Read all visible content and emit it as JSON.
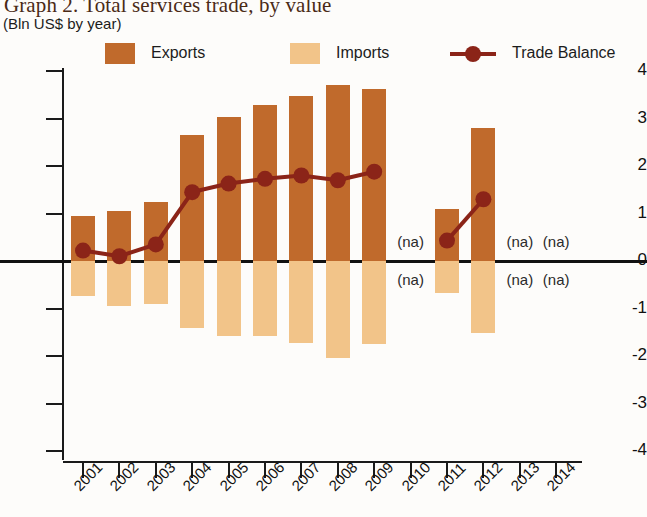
{
  "title": "Graph 2. Total services trade, by value",
  "subtitle": "(Bln US$ by year)",
  "legend": [
    {
      "label": "Exports",
      "type": "swatch",
      "color": "#c06a2c"
    },
    {
      "label": "Imports",
      "type": "swatch",
      "color": "#f2c489"
    },
    {
      "label": "Trade Balance",
      "type": "line",
      "color": "#8b2418"
    }
  ],
  "colors": {
    "exports": "#c06a2c",
    "imports": "#f2c489",
    "trade_balance": "#8b2418",
    "axis": "#1a1a1a"
  },
  "na_label": "(na)",
  "chart_data": {
    "type": "bar",
    "title": "Graph 2. Total services trade, by value",
    "subtitle": "(Bln US$ by year)",
    "xlabel": "",
    "ylabel": "Bln US$ by year",
    "ylim": [
      -4,
      4
    ],
    "yticks": [
      4,
      3,
      2,
      1,
      0,
      -1,
      -2,
      -3,
      -4
    ],
    "ytick_labels": [
      "4",
      "3",
      "2",
      "1",
      "0",
      "-1",
      "-2",
      "-3",
      "-4"
    ],
    "grid": false,
    "legend_position": "top",
    "categories": [
      "2001",
      "2002",
      "2003",
      "2004",
      "2005",
      "2006",
      "2007",
      "2008",
      "2009",
      "2010",
      "2011",
      "2012",
      "2013",
      "2014"
    ],
    "series": [
      {
        "name": "Exports",
        "type": "bar",
        "color": "#c06a2c",
        "values": [
          0.95,
          1.05,
          1.25,
          2.65,
          3.03,
          3.28,
          3.48,
          3.7,
          3.62,
          null,
          1.1,
          2.8,
          null,
          null
        ]
      },
      {
        "name": "Imports",
        "type": "bar",
        "color": "#f2c489",
        "values": [
          -0.73,
          -0.95,
          -0.9,
          -1.4,
          -1.58,
          -1.58,
          -1.72,
          -2.05,
          -1.75,
          null,
          -0.67,
          -1.52,
          null,
          null
        ]
      },
      {
        "name": "Trade Balance",
        "type": "line",
        "color": "#8b2418",
        "values": [
          0.22,
          0.1,
          0.35,
          1.45,
          1.63,
          1.73,
          1.8,
          1.7,
          1.88,
          null,
          0.43,
          1.3,
          null,
          null
        ]
      }
    ],
    "na_years": [
      "2010",
      "2013",
      "2014"
    ],
    "na_note": "Values marked (na) are not available"
  }
}
